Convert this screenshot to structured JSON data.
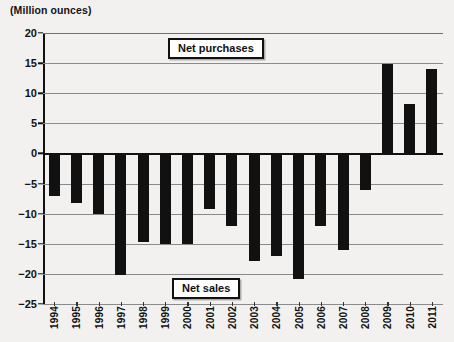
{
  "chart_data": {
    "type": "bar",
    "title": "",
    "ylabel": "(Million ounces)",
    "xlabel": "",
    "ylim": [
      -25,
      20
    ],
    "yticks": [
      20,
      15,
      10,
      5,
      0,
      -5,
      -10,
      -15,
      -20,
      -25
    ],
    "ytick_labels": [
      "20",
      "15",
      "10",
      "5",
      "0",
      "−5",
      "−10",
      "−15",
      "−20",
      "−25"
    ],
    "grid": true,
    "legend_position": "inside",
    "categories": [
      "1994",
      "1995",
      "1996",
      "1997",
      "1998",
      "1999",
      "2000",
      "2001",
      "2002",
      "2003",
      "2004",
      "2005",
      "2006",
      "2007",
      "2008",
      "2009",
      "2010",
      "2011"
    ],
    "values": [
      -7.0,
      -8.2,
      -10.0,
      -20.2,
      -14.7,
      -15.0,
      -15.1,
      -9.3,
      -12.0,
      -17.8,
      -17.0,
      -20.8,
      -12.0,
      -16.0,
      -6.0,
      14.8,
      8.2,
      14.0
    ],
    "annotations": [
      {
        "text": "Net purchases",
        "region": "upper"
      },
      {
        "text": "Net sales",
        "region": "lower"
      }
    ],
    "bar_color": "#111111"
  },
  "labels": {
    "unit_title": "(Million ounces)",
    "legend_purchases": "Net purchases",
    "legend_sales": "Net sales"
  }
}
